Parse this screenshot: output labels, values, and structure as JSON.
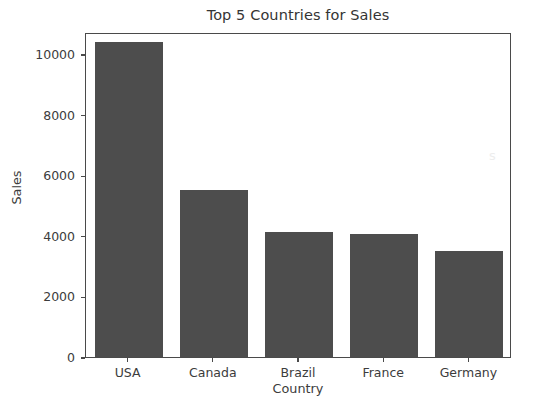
{
  "chart_data": {
    "type": "bar",
    "title": "Top 5 Countries for Sales",
    "xlabel": "Country",
    "ylabel": "Sales",
    "categories": [
      "USA",
      "Canada",
      "Brazil",
      "France",
      "Germany"
    ],
    "values": [
      10400,
      5500,
      4120,
      4050,
      3500
    ],
    "ytick_labels": [
      "0",
      "2000",
      "4000",
      "6000",
      "8000",
      "10000"
    ],
    "ytick_values": [
      0,
      2000,
      4000,
      6000,
      8000,
      10000
    ],
    "ylim": [
      0,
      10730
    ],
    "xlim": [
      -0.5,
      4.5
    ],
    "grid": false,
    "legend": null,
    "bar_color": "#4d4d4d",
    "frame_color": "#4a4a4a",
    "background_color": "#ffffff"
  },
  "artifact": {
    "watermark_glyph": "s"
  }
}
